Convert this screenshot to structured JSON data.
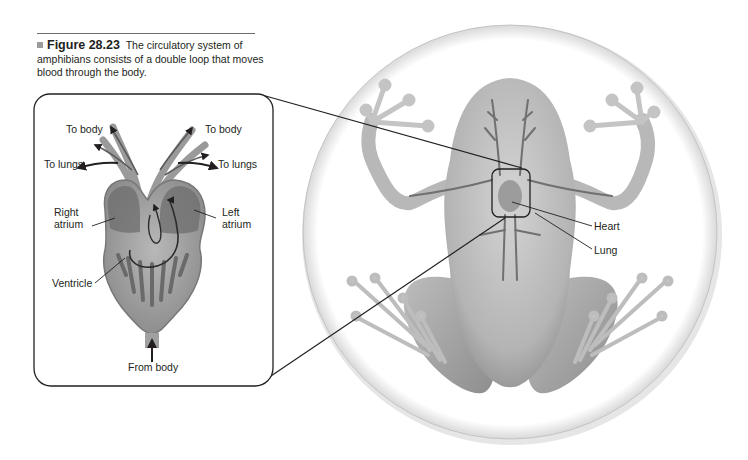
{
  "caption": {
    "figure_number": "Figure 28.23",
    "text": "The circulatory system of amphibians consists of a double loop that moves blood through the body."
  },
  "inset": {
    "labels": {
      "to_body_left": "To body",
      "to_body_right": "To body",
      "to_lungs_left": "To lungs",
      "to_lungs_right": "To lungs",
      "right_atrium_1": "Right",
      "right_atrium_2": "atrium",
      "left_atrium_1": "Left",
      "left_atrium_2": "atrium",
      "ventricle": "Ventricle",
      "from_body": "From body"
    }
  },
  "frog": {
    "labels": {
      "heart": "Heart",
      "lung": "Lung"
    }
  },
  "colors": {
    "outline": "#231f20",
    "frog_skin": "#c8c8c8",
    "frog_shadow": "#8c8c8c",
    "vessels": "#6a6a6a",
    "heart_fill": "#a8a8a8"
  }
}
